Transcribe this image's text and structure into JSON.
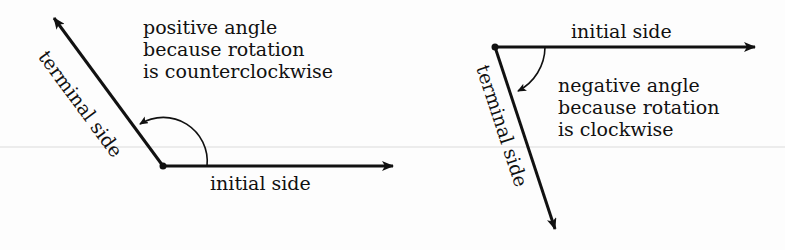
{
  "diagram": {
    "colors": {
      "ink": "#111111",
      "background": "#fdfdfd",
      "scanline": "#d9d9d9"
    },
    "left_figure": {
      "description": "positive angle",
      "caption_lines": [
        "positive angle",
        "because rotation",
        "is counterclockwise"
      ],
      "terminal_label": "terminal side",
      "initial_label": "initial side",
      "rotation": "counterclockwise"
    },
    "right_figure": {
      "description": "negative angle",
      "caption_lines": [
        "negative angle",
        "because rotation",
        "is clockwise"
      ],
      "terminal_label": "terminal side",
      "initial_label": "initial side",
      "rotation": "clockwise"
    }
  }
}
